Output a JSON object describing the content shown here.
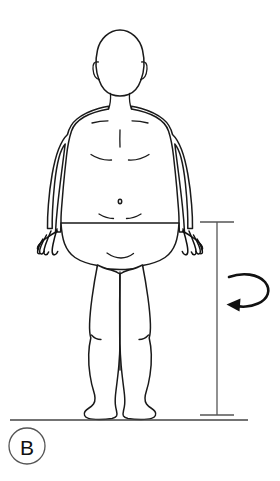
{
  "figure": {
    "panel_label": "B",
    "background_color": "#ffffff",
    "line_color": "#1a1a1a",
    "guide_color": "#555555",
    "width": 280,
    "height": 481
  },
  "subject": {
    "name": "human-figure-anterior-view",
    "orientation": "front",
    "posture": "standing upright, arms relaxed at sides, feet together",
    "parts": [
      "head",
      "ears",
      "neck",
      "clavicles",
      "shoulders",
      "chest",
      "abdomen",
      "navel",
      "left-arm",
      "right-arm",
      "left-hand",
      "right-hand",
      "pelvis",
      "left-leg",
      "right-leg",
      "knees",
      "left-foot",
      "right-foot"
    ]
  },
  "annotations": {
    "height_dimension": {
      "name": "vertical-height-dimension-line",
      "label": "",
      "x": 217,
      "y_top": 222,
      "y_bottom": 415,
      "cap_width": 34
    },
    "rotation_arrow": {
      "name": "axial-rotation-arrow",
      "label": "",
      "direction": "counter-clockwise",
      "points": "left"
    },
    "ground": {
      "name": "ground-reference-line",
      "y": 420,
      "x_start": 10,
      "x_end": 248
    }
  }
}
